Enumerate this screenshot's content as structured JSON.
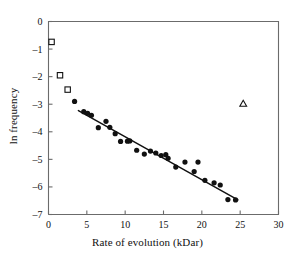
{
  "chart_data": {
    "type": "scatter",
    "title": "",
    "xlabel": "Rate of evolution (kDar)",
    "ylabel": "ln frequency",
    "xlim": [
      0,
      30
    ],
    "ylim": [
      -7,
      0
    ],
    "xticks": [
      0,
      5,
      10,
      15,
      20,
      25,
      30
    ],
    "xtick_labels": [
      "0",
      "5",
      "10",
      "15",
      "20",
      "25",
      "30"
    ],
    "yticks": [
      0,
      -1,
      -2,
      -3,
      -4,
      -5,
      -6,
      -7
    ],
    "ytick_labels": [
      "0",
      "–1",
      "–2",
      "–3",
      "–4",
      "–5",
      "–6",
      "–7"
    ],
    "grid": false,
    "legend": "none",
    "series": [
      {
        "name": "main data",
        "marker": "filled-circle",
        "color": "#111111",
        "points": [
          [
            3.4,
            -2.9
          ],
          [
            4.6,
            -3.27
          ],
          [
            5.1,
            -3.33
          ],
          [
            5.6,
            -3.4
          ],
          [
            6.5,
            -3.85
          ],
          [
            7.5,
            -3.62
          ],
          [
            8.0,
            -3.84
          ],
          [
            8.7,
            -4.07
          ],
          [
            9.4,
            -4.35
          ],
          [
            10.3,
            -4.34
          ],
          [
            10.6,
            -4.33
          ],
          [
            11.5,
            -4.67
          ],
          [
            12.5,
            -4.81
          ],
          [
            13.3,
            -4.7
          ],
          [
            14.0,
            -4.77
          ],
          [
            14.7,
            -4.86
          ],
          [
            15.3,
            -4.83
          ],
          [
            15.6,
            -4.96
          ],
          [
            16.6,
            -5.28
          ],
          [
            17.8,
            -5.1
          ],
          [
            19.0,
            -5.44
          ],
          [
            19.5,
            -5.1
          ],
          [
            20.4,
            -5.76
          ],
          [
            21.6,
            -5.85
          ],
          [
            22.4,
            -5.93
          ],
          [
            23.4,
            -6.46
          ],
          [
            24.4,
            -6.47
          ]
        ]
      },
      {
        "name": "open square outliers",
        "marker": "open-square",
        "color": "#111111",
        "points": [
          [
            0.4,
            -0.74
          ],
          [
            1.5,
            -1.95
          ],
          [
            2.5,
            -2.47
          ]
        ]
      },
      {
        "name": "open triangle outlier",
        "marker": "open-triangle",
        "color": "#111111",
        "points": [
          [
            25.4,
            -2.98
          ]
        ]
      }
    ],
    "fit_line": {
      "name": "regression line",
      "x_start": 3.9,
      "y_start": -3.23,
      "x_end": 24.7,
      "y_end": -6.47,
      "slope": -0.1558,
      "intercept": -2.622,
      "color": "#111111"
    }
  },
  "style": {
    "axis_color": "#6b6b6b",
    "marker_color": "#111111",
    "background": "#ffffff"
  }
}
